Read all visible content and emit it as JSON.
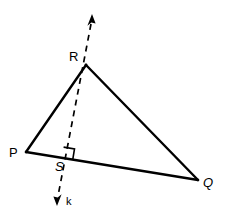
{
  "figure": {
    "kind": "geometry-diagram",
    "background_color": "#ffffff",
    "stroke_color": "#000000",
    "canvas": {
      "width": 225,
      "height": 218
    }
  },
  "points": {
    "P": {
      "label": "P",
      "x": 26,
      "y": 152,
      "label_x": 9,
      "label_y": 146
    },
    "Q": {
      "label": "Q",
      "x": 198,
      "y": 180,
      "label_x": 203,
      "label_y": 176
    },
    "R": {
      "label": "R",
      "x": 86,
      "y": 65,
      "label_x": 69,
      "label_y": 50
    },
    "S": {
      "label": "S",
      "x": 68,
      "y": 158,
      "label_x": 55,
      "label_y": 160
    }
  },
  "segments": [
    {
      "name": "PR",
      "from": "P",
      "to": "R",
      "style": "solid",
      "width": 2.4
    },
    {
      "name": "RQ",
      "from": "R",
      "to": "Q",
      "style": "solid",
      "width": 2.4
    },
    {
      "name": "PQ",
      "from": "P",
      "to": "Q",
      "style": "solid",
      "width": 2.4
    }
  ],
  "line_k": {
    "label": "k",
    "style": "dashed",
    "width": 1.6,
    "dash_pattern": "6 5",
    "top_x": 91,
    "top_y": 18,
    "bottom_x": 58,
    "bottom_y": 200,
    "label_x": 66,
    "label_y": 196,
    "arrow_top": true,
    "arrow_bottom": true
  },
  "right_angle": {
    "name": "right-angle-at-S",
    "size": 11,
    "marker_symbol": "square"
  },
  "labels": {
    "P": "P",
    "Q": "Q",
    "R": "R",
    "S": "S",
    "k": "k"
  }
}
